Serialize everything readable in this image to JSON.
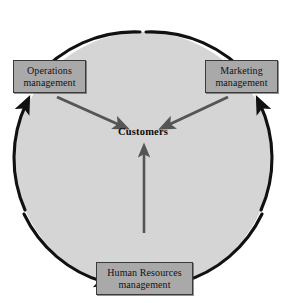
{
  "diagram": {
    "center": {
      "label": "Customers"
    },
    "nodes": [
      {
        "id": "operations",
        "line1": "Operations",
        "line2": "management",
        "position": "top-left"
      },
      {
        "id": "marketing",
        "line1": "Marketing",
        "line2": "management",
        "position": "top-right"
      },
      {
        "id": "human-resources",
        "line1": "Human Resources",
        "line2": "management",
        "position": "bottom-center"
      }
    ],
    "connectors": [
      {
        "id": "operations-to-customers",
        "from": "operations",
        "to": "center",
        "style": "gray-arrow"
      },
      {
        "id": "marketing-to-customers",
        "from": "marketing",
        "to": "center",
        "style": "gray-arrow"
      },
      {
        "id": "hr-to-customers",
        "from": "human-resources",
        "to": "center",
        "style": "gray-arrow"
      }
    ],
    "ring": {
      "shape": "circle",
      "fill": "#d5d5d5",
      "stroke": "#111111",
      "segments": [
        {
          "id": "arc-top-left",
          "direction": "into-operations"
        },
        {
          "id": "arc-top-right",
          "direction": "into-marketing"
        },
        {
          "id": "arc-bottom-left",
          "direction": "into-human-resources"
        },
        {
          "id": "arc-bottom-right",
          "direction": "into-human-resources"
        },
        {
          "id": "arc-left-up",
          "direction": "into-operations"
        },
        {
          "id": "arc-right-up",
          "direction": "into-marketing"
        }
      ]
    },
    "colors": {
      "circle_fill": "#d5d5d5",
      "box_fill": "#a9a9a9",
      "box_border": "#3a3a3a",
      "arc_stroke": "#111111",
      "inner_arrow": "#555555",
      "text": "#121212",
      "background": "#ffffff"
    }
  }
}
